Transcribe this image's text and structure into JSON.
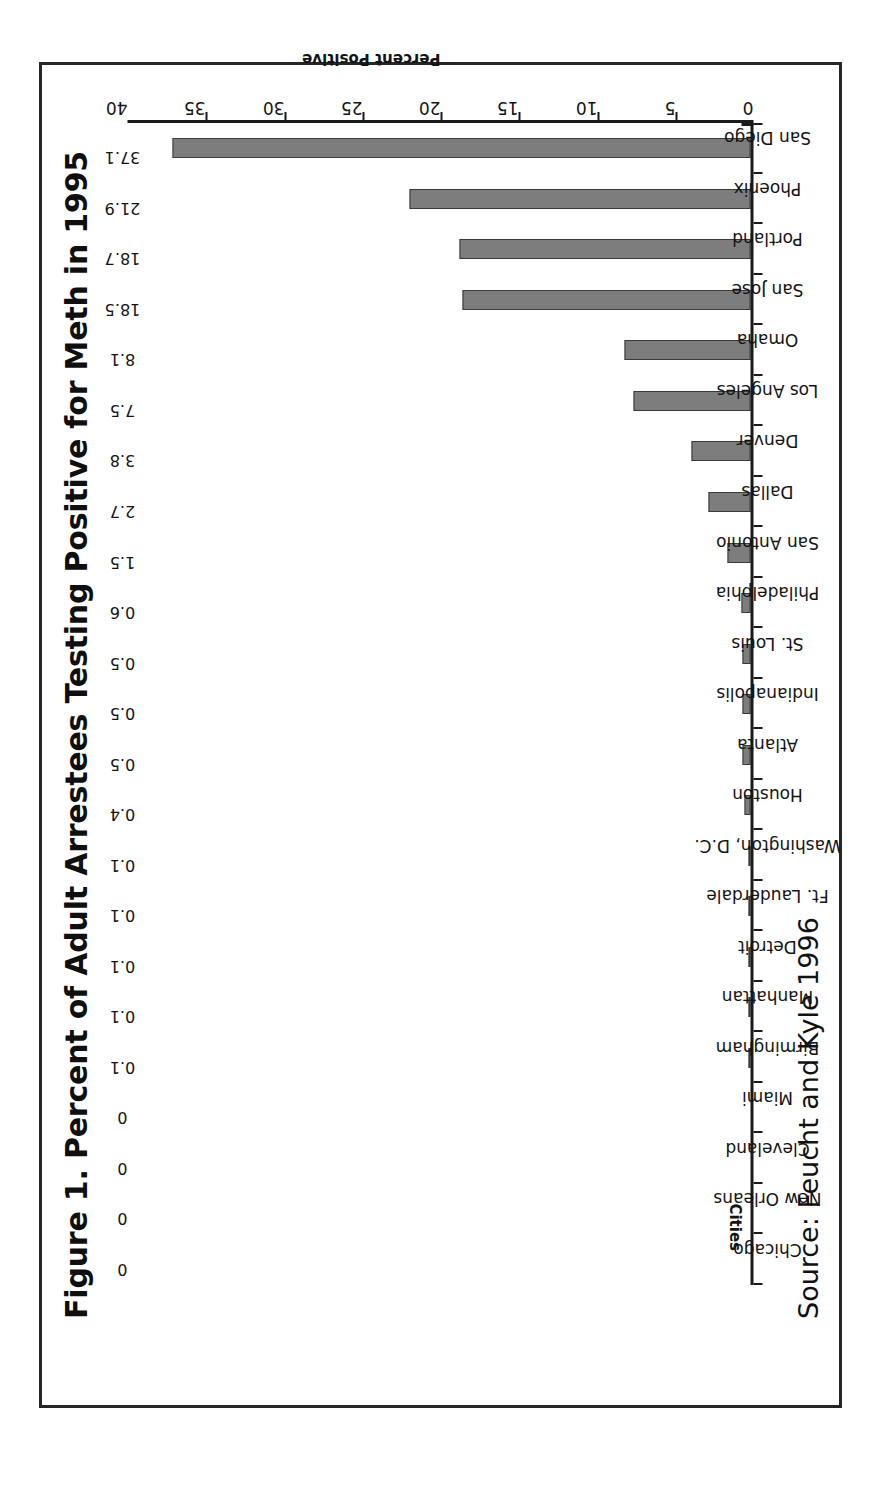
{
  "figure": {
    "title": "Figure 1. Percent of Adult Arrestees Testing Positive for Meth in 1995",
    "source_note": "Source: Feucht and Kyle 1996",
    "category_axis_title": "Cities",
    "value_axis_title": "Percent Positive"
  },
  "chart_data": {
    "type": "bar",
    "orientation": "vertical",
    "title": "Figure 1. Percent of Adult Arrestees Testing Positive for Meth in 1995",
    "xlabel": "Cities",
    "ylabel": "Percent Positive",
    "ylim": [
      0,
      40
    ],
    "ytick_labels": [
      "0",
      "5",
      "10",
      "15",
      "20",
      "25",
      "30",
      "35",
      "40"
    ],
    "yticks": [
      0,
      5,
      10,
      15,
      20,
      25,
      30,
      35,
      40
    ],
    "grid": false,
    "legend": null,
    "bar_color": "#7d7d7d",
    "bar_edge_color": "#3a3a3a",
    "categories": [
      "Chicago",
      "New Orleans",
      "Cleveland",
      "Miami",
      "Birmingham",
      "Manhattan",
      "Detroit",
      "Ft. Lauderdale",
      "Washington, D.C.",
      "Houston",
      "Atlanta",
      "Indianapolis",
      "St. Louis",
      "Philadelphia",
      "San Antonio",
      "Dallas",
      "Denver",
      "Los Angeles",
      "Omaha",
      "San Jose",
      "Portland",
      "Phoenix",
      "San Diego"
    ],
    "values": [
      0,
      0,
      0,
      0,
      0.1,
      0.1,
      0.1,
      0.1,
      0.1,
      0.4,
      0.5,
      0.5,
      0.5,
      0.6,
      1.5,
      2.7,
      3.8,
      7.5,
      8.1,
      18.5,
      18.7,
      21.9,
      37.1
    ],
    "value_labels": [
      "0",
      "0",
      "0",
      "0",
      "0.1",
      "0.1",
      "0.1",
      "0.1",
      "0.1",
      "0.4",
      "0.5",
      "0.5",
      "0.5",
      "0.6",
      "1.5",
      "2.7",
      "3.8",
      "7.5",
      "8.1",
      "18.5",
      "18.7",
      "21.9",
      "37.1"
    ]
  }
}
